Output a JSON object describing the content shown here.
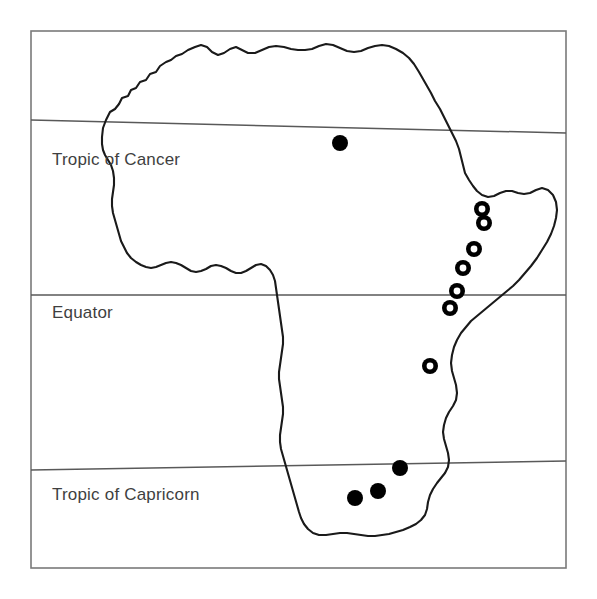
{
  "figure": {
    "kind": "distribution-map",
    "region": "Africa",
    "width": 597,
    "height": 599,
    "background_color": "#ffffff"
  },
  "frame": {
    "x": 31,
    "y": 31,
    "width": 535,
    "height": 537,
    "stroke_color": "#7a7a7a",
    "stroke_width": 1.6
  },
  "latitude_lines": [
    {
      "id": "tropic-of-cancer",
      "label": "Tropic of Cancer",
      "x1": 31,
      "y1": 120,
      "x2": 566,
      "y2": 133,
      "label_x": 52,
      "label_y": 165,
      "stroke_color": "#595959"
    },
    {
      "id": "equator",
      "label": "Equator",
      "x1": 31,
      "y1": 295,
      "x2": 566,
      "y2": 295,
      "label_x": 52,
      "label_y": 318,
      "stroke_color": "#595959"
    },
    {
      "id": "tropic-of-capricorn",
      "label": "Tropic of Capricorn",
      "x1": 31,
      "y1": 470,
      "x2": 566,
      "y2": 461,
      "label_x": 52,
      "label_y": 500,
      "stroke_color": "#595959"
    }
  ],
  "coastline": {
    "stroke_color": "#1a1a1a",
    "stroke_width": 2.1,
    "description": "Outline of the African continent, open at the northern Mediterranean edge and drawn as a single continuous stroke",
    "path": "M 103,128 L 106,120 L 110,112 L 115,109 L 119,104 L 122,98 L 128,96 L 131,90 L 136,88 L 140,82 L 146,80 L 150,74 L 156,72 L 160,66 L 166,62 L 171,60 L 176,56 L 182,54 L 188,50 L 195,47 L 201,45 L 207,47 L 212,52 L 218,55 L 224,53 L 230,49 L 236,47 L 242,50 L 248,53 L 255,53 L 262,50 L 269,47 L 276,46 L 284,47 L 291,49 L 298,50 L 305,50 L 312,49 L 319,46 L 326,44 L 333,45 L 340,48 L 347,51 L 354,52 L 361,51 L 368,48 L 375,46 L 382,45 L 389,46 L 396,49 L 403,53 L 409,58 L 414,64 L 419,72 L 423,79 L 427,86 L 431,93 L 435,101 L 440,109 L 444,117 L 448,125 L 452,133 L 456,141 L 459,149 L 461,157 L 463,165 L 465,173 L 469,180 L 473,186 L 477,191 L 482,195 L 488,197 L 494,196 L 500,193 L 506,191 L 512,191 L 518,193 L 524,194 L 530,193 L 536,190 L 542,188 L 548,190 L 553,195 L 556,202 L 557,210 L 556,218 L 554,226 L 551,234 L 547,242 L 542,250 L 537,258 L 531,266 L 525,273 L 519,280 L 513,286 L 507,291 L 501,296 L 495,301 L 489,306 L 483,311 L 477,316 L 471,321 L 466,327 L 461,333 L 457,340 L 454,347 L 452,355 L 451,363 L 452,371 L 454,378 L 456,385 L 457,393 L 456,400 L 453,406 L 449,412 L 446,418 L 444,425 L 443,432 L 444,439 L 446,446 L 448,453 L 449,460 L 448,467 L 445,473 L 441,478 L 437,483 L 433,489 L 430,495 L 428,502 L 427,509 L 425,515 L 421,520 L 416,524 L 410,527 L 403,530 L 396,532 L 389,534 L 382,535 L 375,536 L 368,536 L 361,535 L 354,534 L 347,533 L 340,533 L 333,534 L 326,535 L 319,535 L 313,533 L 308,529 L 304,524 L 301,518 L 299,512 L 297,505 L 295,498 L 293,491 L 291,484 L 289,477 L 287,470 L 285,463 L 283,456 L 281,449 L 280,442 L 280,435 L 281,428 L 282,421 L 283,414 L 283,407 L 282,400 L 281,393 L 280,386 L 279,379 L 279,372 L 280,365 L 281,358 L 282,351 L 283,344 L 283,337 L 282,330 L 281,323 L 280,316 L 279,309 L 278,302 L 277,295 L 276,288 L 275,281 L 273,275 L 270,270 L 266,266 L 261,264 L 256,265 L 251,268 L 246,271 L 241,273 L 236,273 L 231,271 L 226,268 L 221,266 L 216,265 L 211,266 L 206,269 L 201,271 L 196,272 L 191,271 L 186,268 L 181,265 L 176,263 L 171,262 L 166,263 L 161,265 L 156,267 L 151,268 L 146,267 L 141,265 L 136,262 L 131,258 L 127,253 L 124,247 L 121,241 L 119,234 L 117,227 L 115,220 L 113,213 L 112,206 L 112,199 L 113,192 L 114,185 L 114,178 L 113,171 L 111,165 L 108,160 L 105,155 L 103,150 L 102,144 L 102,137 Z"
  },
  "markers": {
    "filled": {
      "style": "solid-filled-circle",
      "fill_color": "#000000",
      "radius": 8,
      "count": 4,
      "points": [
        {
          "id": "filled-1",
          "x": 340,
          "y": 143,
          "region": "central-sahara"
        },
        {
          "id": "filled-2",
          "x": 400,
          "y": 468,
          "region": "southern-africa-north"
        },
        {
          "id": "filled-3",
          "x": 378,
          "y": 491,
          "region": "southern-africa-center"
        },
        {
          "id": "filled-4",
          "x": 355,
          "y": 498,
          "region": "southern-africa-west"
        }
      ]
    },
    "open": {
      "style": "open-ring-circle",
      "ring_color": "#000000",
      "center_color": "#ffffff",
      "outer_radius": 8,
      "inner_radius": 3.4,
      "count": 7,
      "points": [
        {
          "id": "ring-1",
          "x": 482,
          "y": 209,
          "region": "ethiopia-north"
        },
        {
          "id": "ring-2",
          "x": 484,
          "y": 223,
          "region": "ethiopia-south"
        },
        {
          "id": "ring-3",
          "x": 474,
          "y": 249,
          "region": "east-africa-1"
        },
        {
          "id": "ring-4",
          "x": 463,
          "y": 268,
          "region": "east-africa-2"
        },
        {
          "id": "ring-5",
          "x": 457,
          "y": 291,
          "region": "equatorial-east-africa"
        },
        {
          "id": "ring-6",
          "x": 450,
          "y": 308,
          "region": "east-africa-3"
        },
        {
          "id": "ring-7",
          "x": 430,
          "y": 366,
          "region": "south-central-africa"
        }
      ]
    }
  }
}
